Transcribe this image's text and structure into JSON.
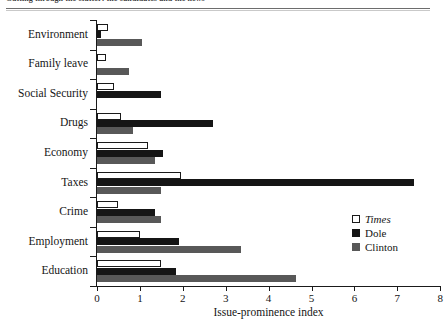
{
  "figure": {
    "caption_cut_off": "Cutting through the clutter: the candidates and the news",
    "axis_title": "Issue-prominence index"
  },
  "legend": {
    "position": "bottom-right",
    "entries": [
      {
        "label": "Times",
        "swatch": "hollow-square-icon",
        "color": "#ffffff",
        "italic": true
      },
      {
        "label": "Dole",
        "swatch": "black-square-icon",
        "color": "#151515",
        "italic": false
      },
      {
        "label": "Clinton",
        "swatch": "gray-square-icon",
        "color": "#585858",
        "italic": false
      }
    ]
  },
  "xaxis": {
    "ticks": [
      "0",
      "1",
      "2",
      "3",
      "4",
      "5",
      "6",
      "7",
      "8"
    ]
  },
  "chart_data": {
    "type": "bar",
    "orientation": "horizontal",
    "title": "",
    "xlabel": "Issue-prominence index",
    "ylabel": "",
    "xlim": [
      0,
      8
    ],
    "grid": false,
    "legend_position": "bottom-right",
    "categories": [
      "Environment",
      "Family leave",
      "Social Security",
      "Drugs",
      "Economy",
      "Taxes",
      "Crime",
      "Employment",
      "Education"
    ],
    "series": [
      {
        "name": "Times",
        "color": "#ffffff",
        "values": [
          0.25,
          0.2,
          0.4,
          0.55,
          1.2,
          1.95,
          0.5,
          1.0,
          1.5
        ]
      },
      {
        "name": "Dole",
        "color": "#151515",
        "values": [
          0.1,
          0.0,
          1.5,
          2.7,
          1.55,
          7.4,
          1.35,
          1.9,
          1.85
        ]
      },
      {
        "name": "Clinton",
        "color": "#585858",
        "values": [
          1.05,
          0.75,
          0.0,
          0.85,
          1.35,
          1.5,
          1.5,
          3.35,
          4.65
        ]
      }
    ]
  }
}
